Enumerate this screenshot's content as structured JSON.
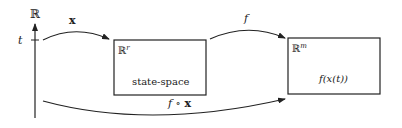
{
  "axis": {
    "label": "ℝ",
    "tick_label": "t"
  },
  "arrows": {
    "x_label": "x",
    "f_label": "f",
    "composition_label_f": "f",
    "composition_label_op": " ∘ ",
    "composition_label_x": "x"
  },
  "state_box": {
    "space_label": "ℝ",
    "space_exp": "r",
    "caption": "state-space"
  },
  "output_box": {
    "space_label": "ℝ",
    "space_exp": "m",
    "caption": "f(x(t))"
  },
  "colors": {
    "stroke": "#222222",
    "background": "#ffffff"
  }
}
